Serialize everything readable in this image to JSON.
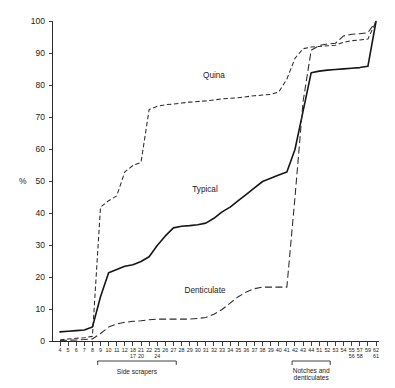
{
  "chart_data": {
    "type": "line",
    "title": "",
    "subtitle": "",
    "xlabel": "",
    "ylabel": "%",
    "ylim": [
      0,
      100
    ],
    "yticks": [
      0,
      10,
      20,
      30,
      40,
      50,
      60,
      70,
      80,
      90,
      100
    ],
    "ytick_labels": [
      "0",
      "10",
      "20",
      "30",
      "40",
      "50",
      "60",
      "70",
      "80",
      "90",
      "100"
    ],
    "grid": false,
    "legend_position": "inline-annotations",
    "x_tick_labels_row1": [
      "4",
      "5",
      "6",
      "7",
      "8",
      "9",
      "10",
      "11",
      "12",
      "18",
      "21",
      "22",
      "25",
      "26",
      "27",
      "28",
      "29",
      "30",
      "31",
      "32",
      "33",
      "34",
      "35",
      "36",
      "37",
      "38",
      "39",
      "40",
      "41",
      "42",
      "43",
      "44",
      "51",
      "52",
      "53",
      "54",
      "55",
      "57",
      "59",
      "62"
    ],
    "x_tick_labels_row2": [
      "17",
      "20",
      "24",
      "56",
      "58",
      "61"
    ],
    "x_group_labels": [
      "Side scrapers",
      "Notches and denticulates"
    ],
    "series": [
      {
        "name": "Quina",
        "style": "dashed-fine",
        "label_text": "Quina",
        "x": [
          4,
          5,
          6,
          7,
          8,
          9,
          10,
          11,
          12,
          18,
          21,
          22,
          25,
          26,
          27,
          28,
          29,
          30,
          31,
          32,
          33,
          34,
          35,
          36,
          37,
          38,
          39,
          40,
          41,
          42,
          43,
          44,
          51,
          52,
          53,
          54,
          55,
          57,
          59,
          62
        ],
        "values": [
          0.5,
          0.8,
          1.0,
          1.2,
          1.6,
          42.0,
          44.0,
          45.5,
          53.0,
          55.0,
          56.0,
          72.5,
          73.5,
          74.0,
          74.2,
          74.5,
          74.8,
          75.0,
          75.2,
          75.5,
          75.8,
          76.0,
          76.2,
          76.5,
          76.8,
          77.0,
          77.2,
          78.0,
          82.0,
          88.5,
          91.5,
          92.0,
          92.2,
          92.4,
          92.6,
          93.5,
          94.0,
          94.2,
          94.5,
          100.0
        ]
      },
      {
        "name": "Typical",
        "style": "solid",
        "label_text": "Typical",
        "x": [
          4,
          5,
          6,
          7,
          8,
          9,
          10,
          11,
          12,
          18,
          21,
          22,
          25,
          26,
          27,
          28,
          29,
          30,
          31,
          32,
          33,
          34,
          35,
          36,
          37,
          38,
          39,
          40,
          41,
          42,
          43,
          44,
          51,
          52,
          53,
          54,
          55,
          57,
          59,
          62
        ],
        "values": [
          3.0,
          3.2,
          3.4,
          3.6,
          4.5,
          14.0,
          21.5,
          22.5,
          23.5,
          24.0,
          25.0,
          26.5,
          30.0,
          33.0,
          35.5,
          36.0,
          36.2,
          36.5,
          37.0,
          38.5,
          40.5,
          42.0,
          44.0,
          46.0,
          48.0,
          50.0,
          51.0,
          52.0,
          53.0,
          60.0,
          72.0,
          84.0,
          84.5,
          84.8,
          85.0,
          85.2,
          85.4,
          85.6,
          86.0,
          100.0
        ]
      },
      {
        "name": "Denticulate",
        "style": "dashed-long",
        "label_text": "Denticulate",
        "x": [
          4,
          5,
          6,
          7,
          8,
          9,
          10,
          11,
          12,
          18,
          21,
          22,
          25,
          26,
          27,
          28,
          29,
          30,
          31,
          32,
          33,
          34,
          35,
          36,
          37,
          38,
          39,
          40,
          41,
          42,
          43,
          44,
          51,
          52,
          53,
          54,
          55,
          57,
          59,
          62
        ],
        "values": [
          0.3,
          0.4,
          0.5,
          0.6,
          0.8,
          2.5,
          4.5,
          5.5,
          6.0,
          6.3,
          6.5,
          6.8,
          7.0,
          7.0,
          7.0,
          7.0,
          7.0,
          7.2,
          7.5,
          8.5,
          10.0,
          12.0,
          14.0,
          15.5,
          16.5,
          17.0,
          17.0,
          17.0,
          17.0,
          45.0,
          75.0,
          91.0,
          92.5,
          93.0,
          93.2,
          95.5,
          96.0,
          96.2,
          96.5,
          100.0
        ]
      }
    ],
    "annotations": [
      {
        "text": "Quina",
        "x_px": 214,
        "y_px": 78
      },
      {
        "text": "Typical",
        "x_px": 205,
        "y_px": 192
      },
      {
        "text": "Denticulate",
        "x_px": 205,
        "y_px": 293
      }
    ]
  }
}
